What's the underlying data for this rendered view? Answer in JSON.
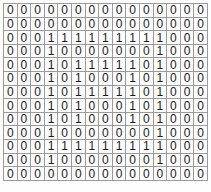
{
  "grid": {
    "title": "binary-matrix",
    "rows": 13,
    "cols": 15,
    "cell_border_color": "#9b9b9b",
    "text_color": "#1a1a1a",
    "background_color": "#ffffff",
    "values": [
      [
        "0",
        "0",
        "0",
        "0",
        "0",
        "0",
        "0",
        "0",
        "0",
        "0",
        "0",
        "0",
        "0",
        "0",
        "0"
      ],
      [
        "0",
        "0",
        "0",
        "0",
        "0",
        "0",
        "0",
        "0",
        "0",
        "0",
        "0",
        "0",
        "0",
        "0",
        "0"
      ],
      [
        "0",
        "0",
        "0",
        "1",
        "1",
        "1",
        "1",
        "1",
        "1",
        "1",
        "1",
        "1",
        "0",
        "0",
        "0"
      ],
      [
        "0",
        "0",
        "0",
        "1",
        "0",
        "0",
        "0",
        "0",
        "0",
        "0",
        "0",
        "1",
        "0",
        "0",
        "0"
      ],
      [
        "0",
        "0",
        "0",
        "1",
        "0",
        "1",
        "1",
        "1",
        "1",
        "1",
        "0",
        "1",
        "0",
        "0",
        "0"
      ],
      [
        "0",
        "0",
        "0",
        "1",
        "0",
        "1",
        "0",
        "0",
        "0",
        "1",
        "0",
        "1",
        "0",
        "0",
        "0"
      ],
      [
        "0",
        "0",
        "0",
        "1",
        "0",
        "1",
        "1",
        "1",
        "1",
        "1",
        "0",
        "1",
        "0",
        "0",
        "0"
      ],
      [
        "0",
        "0",
        "0",
        "1",
        "0",
        "1",
        "0",
        "0",
        "0",
        "1",
        "0",
        "1",
        "0",
        "0",
        "0"
      ],
      [
        "0",
        "0",
        "0",
        "1",
        "0",
        "1",
        "0",
        "0",
        "0",
        "1",
        "0",
        "1",
        "0",
        "0",
        "0"
      ],
      [
        "0",
        "0",
        "0",
        "1",
        "0",
        "0",
        "0",
        "0",
        "0",
        "0",
        "0",
        "1",
        "0",
        "0",
        "0"
      ],
      [
        "0",
        "0",
        "0",
        "1",
        "1",
        "1",
        "1",
        "1",
        "1",
        "1",
        "1",
        "1",
        "0",
        "0",
        "0"
      ],
      [
        "0",
        "0",
        "0",
        "1",
        "0",
        "0",
        "0",
        "0",
        "0",
        "0",
        "0",
        "1",
        "0",
        "0",
        "0"
      ],
      [
        "0",
        "0",
        "0",
        "0",
        "0",
        "0",
        "0",
        "0",
        "0",
        "0",
        "0",
        "0",
        "0",
        "0",
        "0"
      ]
    ]
  }
}
